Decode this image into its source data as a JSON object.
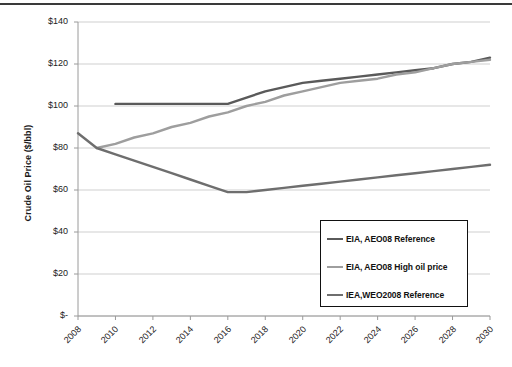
{
  "chart_data": {
    "type": "line",
    "title": "",
    "xlabel": "",
    "ylabel": "Crude Oil Price ($/bbl)",
    "xlim": [
      2008,
      2030
    ],
    "ylim": [
      0,
      140
    ],
    "grid": true,
    "legend_position": "lower-right",
    "x_ticks": [
      "2008",
      "2010",
      "2012",
      "2014",
      "2016",
      "2018",
      "2020",
      "2022",
      "2024",
      "2026",
      "2028",
      "2030"
    ],
    "y_ticks": [
      "$-",
      "$20",
      "$40",
      "$60",
      "$80",
      "$100",
      "$120",
      "$140"
    ],
    "y_tick_values": [
      0,
      20,
      40,
      60,
      80,
      100,
      120,
      140
    ],
    "series": [
      {
        "name": "EIA, AEO08 Reference",
        "color": "#5a5a5a",
        "x": [
          2010,
          2011,
          2012,
          2013,
          2014,
          2015,
          2016,
          2017,
          2018,
          2019,
          2020,
          2021,
          2022,
          2023,
          2024,
          2025,
          2026,
          2027,
          2028,
          2029,
          2030
        ],
        "values": [
          101,
          101,
          101,
          101,
          101,
          101,
          101,
          104,
          107,
          109,
          111,
          112,
          113,
          114,
          115,
          116,
          117,
          118,
          120,
          121,
          123
        ]
      },
      {
        "name": "EIA, AEO08 High oil price",
        "color": "#9e9e9e",
        "x": [
          2009,
          2010,
          2011,
          2012,
          2013,
          2014,
          2015,
          2016,
          2017,
          2018,
          2019,
          2020,
          2021,
          2022,
          2023,
          2024,
          2025,
          2026,
          2027,
          2028,
          2029,
          2030
        ],
        "values": [
          80,
          82,
          85,
          87,
          90,
          92,
          95,
          97,
          100,
          102,
          105,
          107,
          109,
          111,
          112,
          113,
          115,
          116,
          118,
          120,
          121,
          122
        ]
      },
      {
        "name": "IEA,WEO2008 Reference",
        "color": "#6e6e6e",
        "x": [
          2008,
          2009,
          2010,
          2011,
          2012,
          2013,
          2014,
          2015,
          2016,
          2017,
          2018,
          2019,
          2020,
          2021,
          2022,
          2023,
          2024,
          2025,
          2026,
          2027,
          2028,
          2029,
          2030
        ],
        "values": [
          87,
          80,
          77,
          74,
          71,
          68,
          65,
          62,
          59,
          59,
          60,
          61,
          62,
          63,
          64,
          65,
          66,
          67,
          68,
          69,
          70,
          71,
          72
        ]
      }
    ]
  },
  "axis": {
    "y_title": "Crude Oil Price ($/bbl)"
  },
  "legend": {
    "items": [
      {
        "label": "EIA, AEO08 Reference",
        "color": "#5a5a5a"
      },
      {
        "label": "EIA, AEO08 High oil price",
        "color": "#9e9e9e"
      },
      {
        "label": "IEA,WEO2008 Reference",
        "color": "#6e6e6e"
      }
    ]
  }
}
